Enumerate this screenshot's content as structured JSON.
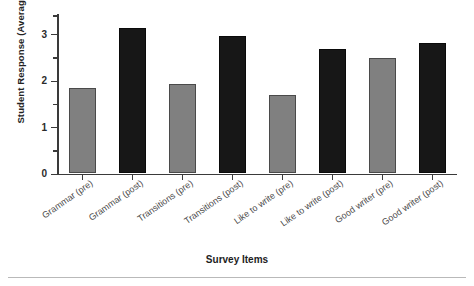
{
  "chart_data": {
    "type": "bar",
    "title": "",
    "xlabel": "Survey Items",
    "ylabel": "Student Response (Average)",
    "categories": [
      "Grammar (pre)",
      "Grammar (post)",
      "Transitions (pre)",
      "Transitions (post)",
      "Like to write (pre)",
      "Like to write (post)",
      "Good writer (pre)",
      "Good writer (post)"
    ],
    "values": [
      1.83,
      3.13,
      1.92,
      2.95,
      1.68,
      2.68,
      2.48,
      2.81
    ],
    "bar_groups": [
      "pre",
      "post",
      "pre",
      "post",
      "pre",
      "post",
      "pre",
      "post"
    ],
    "colors": {
      "pre": "#808080",
      "post": "#171717",
      "axis": "#3a3a3a",
      "text": "#222222"
    },
    "ylim": [
      0,
      3.43
    ],
    "ytick_labels": [
      "0",
      "1",
      "2",
      "3"
    ],
    "ytick_values": [
      0,
      1,
      2,
      3
    ],
    "yminor_tick_values": [
      0.5,
      1.5,
      2.5,
      3.4
    ],
    "grid": false,
    "legend": "none",
    "label_rotation_degrees": -35
  }
}
